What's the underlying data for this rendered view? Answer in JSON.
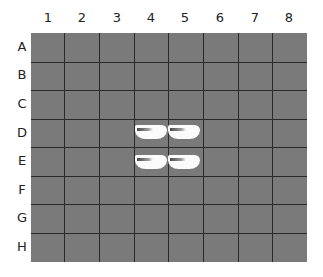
{
  "grid": {
    "columns": [
      "1",
      "2",
      "3",
      "4",
      "5",
      "6",
      "7",
      "8"
    ],
    "rows": [
      "A",
      "B",
      "C",
      "D",
      "E",
      "F",
      "G",
      "H"
    ],
    "board_color": "#7a7a7a",
    "line_color": "#2a2a2a"
  },
  "pieces": [
    {
      "cell": "D4",
      "type": "white-piece"
    },
    {
      "cell": "D5",
      "type": "white-piece"
    },
    {
      "cell": "E4",
      "type": "white-piece"
    },
    {
      "cell": "E5",
      "type": "white-piece"
    }
  ]
}
